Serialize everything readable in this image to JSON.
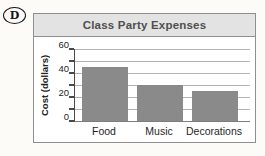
{
  "page": {
    "background": "#fcfbf7"
  },
  "answer_choice": {
    "label": "D"
  },
  "chart": {
    "title_bg": "#e3e3e3",
    "title_color": "#4f4f4f",
    "bar_color": "#8a8a8a",
    "gridline_color": "#b3b3b3"
  },
  "chart_data": {
    "type": "bar",
    "title": "Class Party Expenses",
    "categories": [
      "Food",
      "Music",
      "Decorations"
    ],
    "values": [
      45,
      30,
      25
    ],
    "xlabel": "",
    "ylabel": "Cost (dollars)",
    "ylim": [
      0,
      60
    ],
    "yticks": [
      0,
      20,
      40,
      60
    ],
    "gridline_interval": 10,
    "grid": true,
    "legend": false
  }
}
